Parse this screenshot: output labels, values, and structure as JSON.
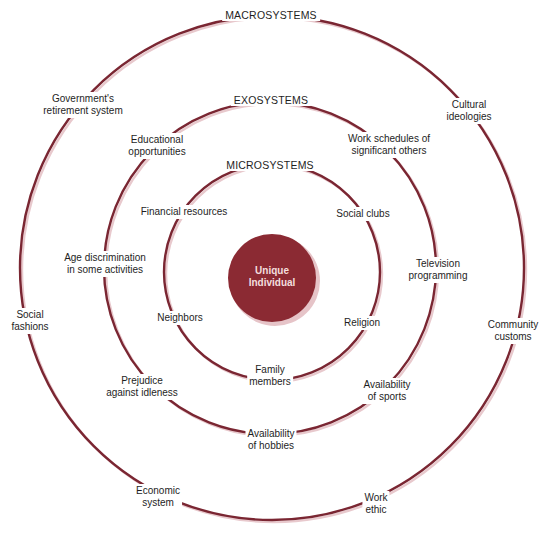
{
  "diagram": {
    "type": "concentric-systems",
    "colors": {
      "ring": "#7a2632",
      "ring_shadow": "#e8c9cd",
      "center_fill": "#8b2a33",
      "center_text": "#f3dede",
      "text": "#1e1e1e",
      "background": "#ffffff"
    },
    "center": {
      "line1": "Unique",
      "line2": "Individual"
    },
    "macrosystems": {
      "title": "MACROSYSTEMS",
      "items": [
        {
          "line1": "Government's",
          "line2": "retirement system"
        },
        {
          "line1": "Cultural",
          "line2": "ideologies"
        },
        {
          "line1": "Social",
          "line2": "fashions"
        },
        {
          "line1": "Community",
          "line2": "customs"
        },
        {
          "line1": "Economic",
          "line2": "system"
        },
        {
          "line1": "Work",
          "line2": "ethic"
        }
      ]
    },
    "exosystems": {
      "title": "EXOSYSTEMS",
      "items": [
        {
          "line1": "Educational",
          "line2": "opportunities"
        },
        {
          "line1": "Work schedules of",
          "line2": "significant others"
        },
        {
          "line1": "Age discrimination",
          "line2": "in some activities"
        },
        {
          "line1": "Television",
          "line2": "programming"
        },
        {
          "line1": "Prejudice",
          "line2": "against idleness"
        },
        {
          "line1": "Availability",
          "line2": "of sports"
        },
        {
          "line1": "Availability",
          "line2": "of hobbies"
        }
      ]
    },
    "microsystems": {
      "title": "MICROSYSTEMS",
      "items": [
        {
          "line1": "Financial resources"
        },
        {
          "line1": "Social clubs"
        },
        {
          "line1": "Neighbors"
        },
        {
          "line1": "Religion"
        },
        {
          "line1": "Family",
          "line2": "members"
        }
      ]
    }
  }
}
